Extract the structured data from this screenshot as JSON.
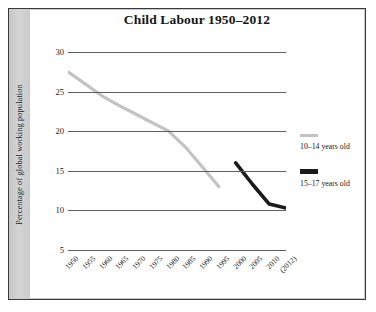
{
  "chart_data": {
    "type": "line",
    "title": "Child Labour 1950–2012",
    "xlabel": "",
    "ylabel": "Percentage of global working population",
    "x": [
      "1950",
      "1955",
      "1960",
      "1965",
      "1970",
      "1975",
      "1980",
      "1985",
      "1990",
      "1995",
      "2000",
      "2005",
      "2010",
      "(2012)"
    ],
    "ylim": [
      5,
      30
    ],
    "yticks": [
      "30",
      "25",
      "20",
      "15",
      "10",
      "5"
    ],
    "ytick_values": [
      30,
      25,
      20,
      15,
      10,
      5
    ],
    "grid": true,
    "legend_position": "right",
    "series": [
      {
        "name": "10–14 years old",
        "color": "#c3c3c3",
        "x": [
          "1950",
          "1955",
          "1960",
          "1965",
          "1970",
          "1975",
          "1980",
          "1985",
          "1990",
          "1995"
        ],
        "values": [
          27.5,
          26.0,
          24.5,
          23.3,
          22.2,
          21.1,
          20.0,
          18.0,
          15.5,
          13.0
        ]
      },
      {
        "name": "15–17 years old",
        "color": "#1b1b1b",
        "x": [
          "2000",
          "2005",
          "2010",
          "(2012)"
        ],
        "values": [
          16.0,
          13.3,
          10.8,
          10.3
        ]
      }
    ]
  },
  "figure": {
    "title": "Child Labour 1950–2012",
    "y_axis_label": "Percentage of global working population"
  },
  "legend": {
    "items": [
      {
        "label": "10–14 years old",
        "swatch": "gray-line-swatch"
      },
      {
        "label": "15–17 years old",
        "swatch": "black-line-swatch"
      }
    ]
  }
}
